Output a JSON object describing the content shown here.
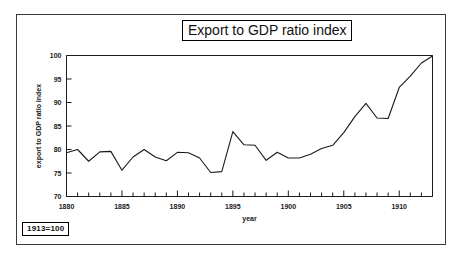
{
  "figure": {
    "title": "Export to GDP ratio index",
    "note": "1913=100"
  },
  "chart_data": {
    "type": "line",
    "title": "Export to GDP ratio index",
    "subtitle": "1913=100",
    "xlabel": "year",
    "ylabel": "export to GDP ratio index",
    "xlim": [
      1880,
      1913
    ],
    "ylim": [
      70,
      100
    ],
    "ytick_labels": [
      "70",
      "75",
      "80",
      "85",
      "90",
      "95",
      "100"
    ],
    "yticks": [
      70,
      75,
      80,
      85,
      90,
      95,
      100
    ],
    "xtick_labels": [
      "1880",
      "1885",
      "1890",
      "1895",
      "1900",
      "1905",
      "1910"
    ],
    "xticks": [
      1880,
      1885,
      1890,
      1895,
      1900,
      1905,
      1910
    ],
    "xtick_minor_step": 1,
    "grid": false,
    "legend": null,
    "series": [
      {
        "name": "export to GDP ratio index",
        "color": "#1a1a1a",
        "x": [
          1880,
          1881,
          1882,
          1883,
          1884,
          1885,
          1886,
          1887,
          1888,
          1889,
          1890,
          1891,
          1892,
          1893,
          1894,
          1895,
          1896,
          1897,
          1898,
          1899,
          1900,
          1901,
          1902,
          1903,
          1904,
          1905,
          1906,
          1907,
          1908,
          1909,
          1910,
          1911,
          1912,
          1913
        ],
        "values": [
          79.3,
          80.0,
          77.5,
          79.5,
          79.6,
          75.6,
          78.4,
          80.0,
          78.4,
          77.6,
          79.4,
          79.3,
          78.2,
          75.1,
          75.3,
          83.8,
          81.0,
          80.9,
          77.7,
          79.4,
          78.2,
          78.2,
          79.0,
          80.2,
          80.9,
          83.6,
          87.0,
          89.8,
          86.7,
          86.6,
          93.2,
          95.6,
          98.4,
          99.9
        ]
      }
    ]
  }
}
